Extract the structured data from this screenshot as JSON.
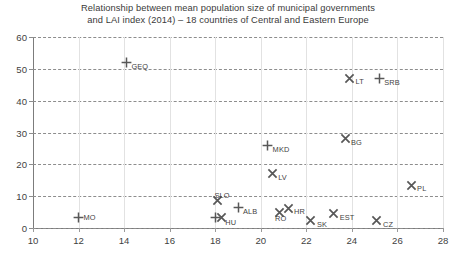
{
  "chart_data": {
    "type": "scatter",
    "title": "Relationship between mean population size of municipal governments\nand LAI index (2014) – 18 countries of Central and Eastern Europe",
    "xlabel": "",
    "ylabel": "",
    "xlim": [
      10,
      28
    ],
    "ylim": [
      0,
      60
    ],
    "xticks": [
      "10",
      "12",
      "14",
      "16",
      "18",
      "20",
      "22",
      "24",
      "26",
      "28"
    ],
    "yticks": [
      "0",
      "10",
      "20",
      "30",
      "40",
      "50",
      "60"
    ],
    "grid": "horizontal-dashed-and-vertical-solid",
    "legend": "none",
    "points": [
      {
        "label": "GEQ",
        "x": 14.1,
        "y": 52.0,
        "marker": "plus",
        "label_dx": 5,
        "label_dy": 4
      },
      {
        "label": "LT",
        "x": 23.9,
        "y": 47.0,
        "marker": "cross",
        "label_dx": 6,
        "label_dy": 3
      },
      {
        "label": "SRB",
        "x": 25.2,
        "y": 47.0,
        "marker": "plus",
        "label_dx": 5,
        "label_dy": 4
      },
      {
        "label": "BG",
        "x": 23.7,
        "y": 28.0,
        "marker": "cross",
        "label_dx": 6,
        "label_dy": 3
      },
      {
        "label": "MKD",
        "x": 20.3,
        "y": 26.0,
        "marker": "plus",
        "label_dx": 5,
        "label_dy": 4
      },
      {
        "label": "LV",
        "x": 20.5,
        "y": 17.0,
        "marker": "cross",
        "label_dx": 6,
        "label_dy": 3
      },
      {
        "label": "PL",
        "x": 26.6,
        "y": 13.5,
        "marker": "cross",
        "label_dx": 6,
        "label_dy": 3
      },
      {
        "label": "SLO",
        "x": 18.1,
        "y": 8.5,
        "marker": "cross",
        "label_dx": -3,
        "label_dy": -6
      },
      {
        "label": "ALB",
        "x": 19.0,
        "y": 6.5,
        "marker": "plus",
        "label_dx": 5,
        "label_dy": 4
      },
      {
        "label": "HR",
        "x": 21.2,
        "y": 6.0,
        "marker": "cross",
        "label_dx": 6,
        "label_dy": 2
      },
      {
        "label": "RO",
        "x": 20.8,
        "y": 5.0,
        "marker": "cross",
        "label_dx": -4,
        "label_dy": 6
      },
      {
        "label": "EST",
        "x": 23.2,
        "y": 4.5,
        "marker": "cross",
        "label_dx": 6,
        "label_dy": 3
      },
      {
        "label": "HU",
        "x": 18.0,
        "y": 3.2,
        "marker": "plus-and-cross",
        "label_dx": 10,
        "label_dy": 4
      },
      {
        "label": "MO",
        "x": 12.0,
        "y": 3.2,
        "marker": "plus",
        "label_dx": 5,
        "label_dy": -1
      },
      {
        "label": "SK",
        "x": 22.2,
        "y": 2.2,
        "marker": "cross",
        "label_dx": 6,
        "label_dy": 3
      },
      {
        "label": "CZ",
        "x": 25.1,
        "y": 2.2,
        "marker": "cross",
        "label_dx": 6,
        "label_dy": 3
      }
    ]
  }
}
